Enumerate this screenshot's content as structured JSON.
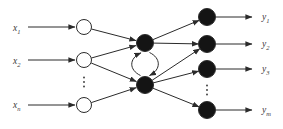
{
  "diagram": {
    "canvas": {
      "width": 283,
      "height": 129,
      "background": "#ffffff"
    },
    "style": {
      "stroke_color": "#2b2b2b",
      "node_fill_dark": "#141414",
      "node_fill_light": "#ffffff",
      "node_stroke": "#2b2b2b",
      "label_color": "#3a3a3a",
      "dot_color": "#333333",
      "label_font_size": 9.5,
      "subscript_font_size": 6.5,
      "line_width": 1
    },
    "labels": [
      {
        "id": "label-x1",
        "base": "x",
        "sub": "1",
        "x": 13,
        "y": 31
      },
      {
        "id": "label-x2",
        "base": "x",
        "sub": "2",
        "x": 13,
        "y": 64
      },
      {
        "id": "label-xn",
        "base": "x",
        "sub": "n",
        "x": 13,
        "y": 108
      },
      {
        "id": "label-y1",
        "base": "y",
        "sub": "1",
        "x": 262,
        "y": 20
      },
      {
        "id": "label-y2",
        "base": "y",
        "sub": "2",
        "x": 262,
        "y": 47
      },
      {
        "id": "label-y3",
        "base": "y",
        "sub": "3",
        "x": 262,
        "y": 72
      },
      {
        "id": "label-ym",
        "base": "y",
        "sub": "m",
        "x": 262,
        "y": 113
      }
    ],
    "nodes": [
      {
        "id": "input-node-1",
        "x": 84,
        "y": 27,
        "r": 7.5,
        "fill": "light"
      },
      {
        "id": "input-node-2",
        "x": 84,
        "y": 60,
        "r": 7.5,
        "fill": "light"
      },
      {
        "id": "input-node-n",
        "x": 84,
        "y": 105,
        "r": 7.5,
        "fill": "light"
      },
      {
        "id": "hidden-node-1",
        "x": 145,
        "y": 43,
        "r": 8.5,
        "fill": "dark"
      },
      {
        "id": "hidden-node-2",
        "x": 145,
        "y": 85,
        "r": 8.5,
        "fill": "dark"
      },
      {
        "id": "output-node-1",
        "x": 207,
        "y": 17,
        "r": 8.5,
        "fill": "dark"
      },
      {
        "id": "output-node-2",
        "x": 207,
        "y": 44,
        "r": 8.5,
        "fill": "dark"
      },
      {
        "id": "output-node-3",
        "x": 207,
        "y": 69,
        "r": 8.5,
        "fill": "dark"
      },
      {
        "id": "output-node-m",
        "x": 207,
        "y": 110,
        "r": 8.5,
        "fill": "dark"
      }
    ],
    "arrows": [
      {
        "id": "arrow-x1-to-input1",
        "x1": 28,
        "y1": 27,
        "x2": 75,
        "y2": 27
      },
      {
        "id": "arrow-x2-to-input2",
        "x1": 28,
        "y1": 60,
        "x2": 75,
        "y2": 60
      },
      {
        "id": "arrow-xn-to-inputn",
        "x1": 28,
        "y1": 105,
        "x2": 75,
        "y2": 105
      },
      {
        "id": "arrow-input1-to-hidden1",
        "x1": 91.4,
        "y1": 29.0,
        "x2": 136.0,
        "y2": 40.6
      },
      {
        "id": "arrow-input2-to-hidden1",
        "x1": 91.4,
        "y1": 58.0,
        "x2": 136.0,
        "y2": 45.5
      },
      {
        "id": "arrow-input2-to-hidden2",
        "x1": 91.2,
        "y1": 63.0,
        "x2": 136.4,
        "y2": 81.5
      },
      {
        "id": "arrow-inputn-to-hidden2",
        "x1": 91.3,
        "y1": 102.6,
        "x2": 136.2,
        "y2": 87.7
      },
      {
        "id": "arrow-hidden1-to-output1",
        "x1": 152.8,
        "y1": 39.7,
        "x2": 199.2,
        "y2": 20.3
      },
      {
        "id": "arrow-hidden1-to-output2",
        "x1": 153.5,
        "y1": 43.1,
        "x2": 198.5,
        "y2": 43.9
      },
      {
        "id": "arrow-hidden2-to-output2",
        "x1": 152.1,
        "y1": 80.3,
        "x2": 199.9,
        "y2": 48.7
      },
      {
        "id": "arrow-hidden2-to-output3",
        "x1": 153.2,
        "y1": 82.9,
        "x2": 198.8,
        "y2": 71.1
      },
      {
        "id": "arrow-hidden2-to-outputm",
        "x1": 152.9,
        "y1": 88.2,
        "x2": 199.1,
        "y2": 106.8
      },
      {
        "id": "arrow-output1-to-y1",
        "x1": 216,
        "y1": 17,
        "x2": 252,
        "y2": 17
      },
      {
        "id": "arrow-output2-to-y2",
        "x1": 216,
        "y1": 44,
        "x2": 252,
        "y2": 44
      },
      {
        "id": "arrow-output3-to-y3",
        "x1": 216,
        "y1": 69,
        "x2": 252,
        "y2": 69
      },
      {
        "id": "arrow-outputm-to-ym",
        "x1": 216,
        "y1": 110,
        "x2": 252,
        "y2": 110
      }
    ],
    "recurrent_arcs": [
      {
        "id": "recurrent-arc-up",
        "d": "M 140.5 75.5 C 129 70 128.5 58.5 141 52.8"
      },
      {
        "id": "recurrent-arc-down",
        "d": "M 149.5 52.5 C 161 58 161.5 69.5 149.5 75.5"
      }
    ],
    "ellipsis_dots": [
      {
        "id": "input-ellipsis",
        "x": 84,
        "y_start": 77.5,
        "spacing": 4.5,
        "count": 3
      },
      {
        "id": "output-ellipsis",
        "x": 207,
        "y_start": 85.5,
        "spacing": 4.5,
        "count": 3
      }
    ]
  }
}
